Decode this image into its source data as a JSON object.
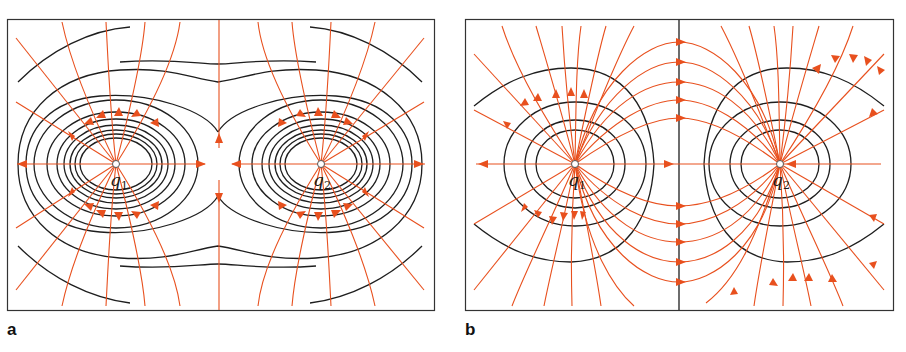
{
  "figure": {
    "panels": [
      {
        "id": "a",
        "label": "a",
        "description": "Field lines and equipotential lines of two equal like charges",
        "charges": [
          {
            "name": "q",
            "subscript": "1",
            "x": 116,
            "y": 164
          },
          {
            "name": "q",
            "subscript": "2",
            "x": 321,
            "y": 164
          }
        ]
      },
      {
        "id": "b",
        "label": "b",
        "description": "Field lines and equipotential lines of two opposite charges",
        "charges": [
          {
            "name": "q",
            "subscript": "1",
            "x": 575,
            "y": 164
          },
          {
            "name": "q",
            "subscript": "2",
            "x": 780,
            "y": 164
          }
        ]
      }
    ],
    "colors": {
      "field_line": "#e8501e",
      "equipotential": "#1e1e1e",
      "frame": "#333333",
      "background": "#ffffff"
    }
  }
}
